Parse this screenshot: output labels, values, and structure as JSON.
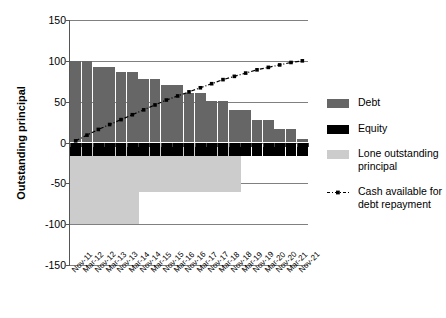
{
  "chart_data": {
    "type": "bar",
    "title": "",
    "subtitle": "",
    "xlabel": "",
    "ylabel": "Outstanding principal",
    "ylim": [
      -150,
      150
    ],
    "yticks": [
      150,
      100,
      50,
      0,
      -50,
      -100,
      -150
    ],
    "grid": true,
    "legend_position": "right",
    "categories": [
      "Nov-11",
      "Mar-12",
      "Nov-12",
      "Mar-13",
      "Nov-13",
      "Mar-14",
      "Nov-14",
      "Mar-15",
      "Nov-15",
      "Mar-16",
      "Nov-16",
      "Mar-17",
      "Nov-17",
      "Mar-18",
      "Nov-18",
      "Mar-19",
      "Nov-19",
      "Mar-20",
      "Nov-20",
      "Mar-21",
      "Nov-21"
    ],
    "bar_x": [
      "Nov-11",
      "May-12",
      "Nov-12",
      "May-13",
      "Nov-13",
      "May-14",
      "Nov-14",
      "May-15",
      "Nov-15",
      "May-16",
      "Nov-16",
      "May-17",
      "Nov-17",
      "May-18",
      "Nov-18",
      "May-19",
      "Nov-19",
      "May-20",
      "Nov-20",
      "May-21",
      "Nov-21"
    ],
    "series": [
      {
        "name": "Debt",
        "color": "#666666",
        "type": "bar",
        "values": [
          100,
          100,
          93,
          93,
          86,
          86,
          78,
          78,
          70,
          70,
          61,
          61,
          51,
          51,
          40,
          40,
          28,
          28,
          16,
          16,
          4
        ]
      },
      {
        "name": "Equity",
        "color": "#000000",
        "type": "bar",
        "values": [
          -17,
          -17,
          -17,
          -17,
          -17,
          -17,
          -17,
          -17,
          -17,
          -17,
          -17,
          -17,
          -17,
          -17,
          -17,
          -17,
          -17,
          -17,
          -17,
          -17,
          -17
        ]
      },
      {
        "name": "Lone outstanding principal",
        "color": "#cccccc",
        "type": "bar",
        "values": [
          -100,
          -100,
          -100,
          -100,
          -100,
          -100,
          -61,
          -61,
          -61,
          -61,
          -61,
          -61,
          -61,
          -61,
          -61,
          0,
          0,
          0,
          0,
          0,
          0
        ]
      },
      {
        "name": "Cash available for debt repayment",
        "color": "#000000",
        "type": "line",
        "style": "dash-dot-marker",
        "values": [
          2,
          9,
          16,
          22,
          28,
          34,
          40,
          46,
          52,
          57,
          62,
          67,
          72,
          77,
          81,
          85,
          89,
          92,
          95,
          98,
          100
        ]
      }
    ]
  },
  "axis": {
    "y_label": "Outstanding principal",
    "y_ticks": [
      "150",
      "100",
      "50",
      "0",
      "-50",
      "-100",
      "-150"
    ],
    "x_ticks": [
      "Nov-11",
      "Mar-12",
      "Nov-12",
      "Mar-13",
      "Nov-13",
      "Mar-14",
      "Nov-14",
      "Mar-15",
      "Nov-15",
      "Mar-16",
      "Nov-16",
      "Mar-17",
      "Nov-17",
      "Mar-18",
      "Nov-18",
      "Mar-19",
      "Nov-19",
      "Mar-20",
      "Nov-20",
      "Mar-21",
      "Nov-21"
    ]
  },
  "legend": {
    "items": [
      {
        "label": "Debt",
        "color": "#666666",
        "marker": "swatch"
      },
      {
        "label": "Equity",
        "color": "#000000",
        "marker": "swatch"
      },
      {
        "label": "Lone outstanding principal",
        "color": "#cccccc",
        "marker": "swatch"
      },
      {
        "label": "Cash available for debt repayment",
        "color": "#000000",
        "marker": "dash-dot-line"
      }
    ]
  },
  "colors": {
    "debt": "#666666",
    "equity": "#000000",
    "loan": "#cccccc",
    "cash_line": "#000000",
    "grid": "#808080",
    "axis": "#555555",
    "background": "#ffffff"
  }
}
